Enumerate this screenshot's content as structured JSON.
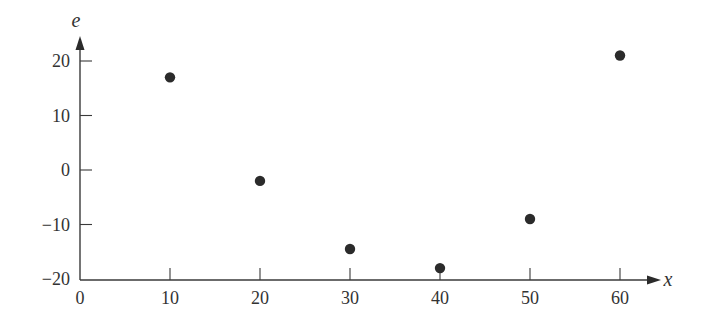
{
  "chart_data": {
    "type": "scatter",
    "title": "",
    "xlabel": "x",
    "ylabel": "e",
    "xlim": [
      0,
      65
    ],
    "ylim": [
      -20,
      25
    ],
    "grid": false,
    "legend": null,
    "x_ticks": [
      0,
      10,
      20,
      30,
      40,
      50,
      60
    ],
    "y_ticks": [
      -20,
      -10,
      0,
      10,
      20
    ],
    "x_tick_labels": [
      "0",
      "10",
      "20",
      "30",
      "40",
      "50",
      "60"
    ],
    "y_tick_labels": [
      "−20",
      "−10",
      "0",
      "10",
      "20"
    ],
    "series": [
      {
        "name": "residuals",
        "color": "#2b2b2b",
        "points": [
          {
            "x": 10,
            "y": 17
          },
          {
            "x": 20,
            "y": -2
          },
          {
            "x": 30,
            "y": -14.5
          },
          {
            "x": 40,
            "y": -18
          },
          {
            "x": 50,
            "y": -9
          },
          {
            "x": 60,
            "y": 21
          }
        ]
      }
    ]
  }
}
